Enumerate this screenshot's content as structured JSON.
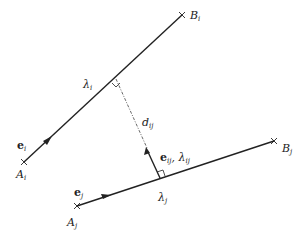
{
  "diagram": {
    "type": "geometry",
    "colors": {
      "line": "#222222",
      "dashed": "#444444",
      "background": "#ffffff"
    },
    "segments": [
      {
        "id": "segment-i",
        "start_label": "A",
        "start_sub": "i",
        "end_label": "B",
        "end_sub": "i",
        "direction_vector": "e",
        "direction_sub": "i",
        "param": "λ",
        "param_sub": "i"
      },
      {
        "id": "segment-j",
        "start_label": "A",
        "start_sub": "j",
        "end_label": "B",
        "end_sub": "j",
        "direction_vector": "e",
        "direction_sub": "j",
        "param": "λ",
        "param_sub": "j"
      }
    ],
    "connector": {
      "distance_label": "d",
      "distance_sub": "ij",
      "vector_label": "e",
      "vector_sub": "ij",
      "param_label": "λ",
      "param_sub": "ij",
      "separator": ", "
    }
  }
}
